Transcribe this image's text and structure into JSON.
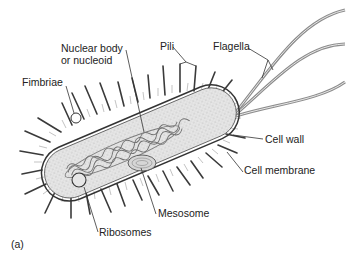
{
  "figure": {
    "panel_label": "(a)"
  },
  "labels": {
    "nucleoid_line1": "Nuclear body",
    "nucleoid_line2": "or nucleoid",
    "pili": "Pili",
    "flagella": "Flagella",
    "fimbriae": "Fimbriae",
    "cell_wall": "Cell wall",
    "cell_membrane": "Cell membrane",
    "mesosome": "Mesosome",
    "ribosomes": "Ribosomes"
  },
  "colors": {
    "outline": "#333333",
    "cytoplasm": "#e4e4e4",
    "nucleoid": "#8a8a8a",
    "flagella": "#9a9a9a",
    "text": "#222222"
  }
}
